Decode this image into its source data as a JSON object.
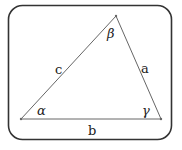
{
  "diagram": {
    "frame": {
      "x": 8,
      "y": 5,
      "width": 164,
      "height": 135,
      "radius": 14,
      "stroke": "#333333"
    },
    "vertices": [
      {
        "name": "alpha-vertex",
        "x": 21,
        "y": 119
      },
      {
        "name": "beta-vertex",
        "x": 116,
        "y": 16
      },
      {
        "name": "gamma-vertex",
        "x": 161,
        "y": 119
      }
    ],
    "line_color": "#666666",
    "sides": {
      "a": "a",
      "b": "b",
      "c": "c"
    },
    "angles": {
      "alpha": "α",
      "beta": "β",
      "gamma": "γ"
    }
  }
}
